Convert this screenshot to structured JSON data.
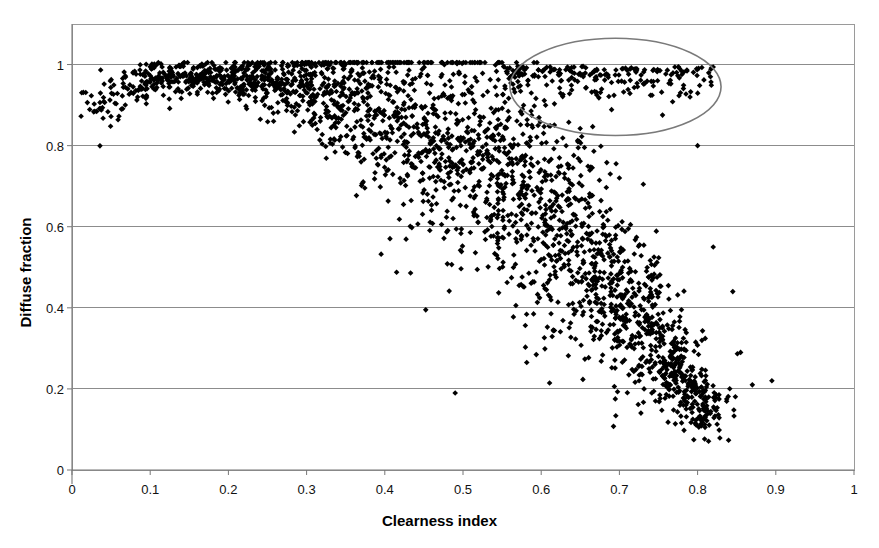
{
  "chart_data": {
    "type": "scatter",
    "title": "",
    "xlabel": "Clearness index",
    "ylabel": "Diffuse fraction",
    "xlim": [
      0,
      1
    ],
    "ylim": [
      0,
      1.1
    ],
    "xticks": [
      "0",
      "0.1",
      "0.2",
      "0.3",
      "0.4",
      "0.5",
      "0.6",
      "0.7",
      "0.8",
      "0.9",
      "1"
    ],
    "xtick_values": [
      0,
      0.1,
      0.2,
      0.3,
      0.4,
      0.5,
      0.6,
      0.7,
      0.8,
      0.9,
      1
    ],
    "yticks": [
      "0",
      "0.2",
      "0.4",
      "0.6",
      "0.8",
      "1"
    ],
    "ytick_values": [
      0,
      0.2,
      0.4,
      0.6,
      0.8,
      1
    ],
    "grid": "horizontal",
    "grid_color": "#808080",
    "legend": "none",
    "marker": {
      "shape": "diamond",
      "color": "#000000",
      "size_px": 5
    },
    "series": [
      {
        "name": "Diffuse fraction vs clearness index",
        "n_points": 2300,
        "description": "Dense scatter of hourly diffuse fraction against clearness index; near-unity plateau for kt below 0.35, steep falling limb between kt 0.35 and 0.8, low-diffuse tail near kt 0.8.",
        "distribution_bins": [
          {
            "kt": 0.02,
            "df_mean": 0.91,
            "df_spread": 0.05,
            "count": 14
          },
          {
            "kt": 0.05,
            "df_mean": 0.93,
            "df_spread": 0.05,
            "count": 28
          },
          {
            "kt": 0.08,
            "df_mean": 0.955,
            "df_spread": 0.04,
            "count": 42
          },
          {
            "kt": 0.11,
            "df_mean": 0.975,
            "df_spread": 0.03,
            "count": 55
          },
          {
            "kt": 0.14,
            "df_mean": 0.978,
            "df_spread": 0.03,
            "count": 62
          },
          {
            "kt": 0.17,
            "df_mean": 0.978,
            "df_spread": 0.035,
            "count": 68
          },
          {
            "kt": 0.2,
            "df_mean": 0.975,
            "df_spread": 0.04,
            "count": 72
          },
          {
            "kt": 0.23,
            "df_mean": 0.972,
            "df_spread": 0.05,
            "count": 76
          },
          {
            "kt": 0.26,
            "df_mean": 0.968,
            "df_spread": 0.06,
            "count": 80
          },
          {
            "kt": 0.29,
            "df_mean": 0.962,
            "df_spread": 0.075,
            "count": 84
          },
          {
            "kt": 0.32,
            "df_mean": 0.952,
            "df_spread": 0.095,
            "count": 88
          },
          {
            "kt": 0.35,
            "df_mean": 0.938,
            "df_spread": 0.115,
            "count": 92
          },
          {
            "kt": 0.38,
            "df_mean": 0.918,
            "df_spread": 0.14,
            "count": 96
          },
          {
            "kt": 0.41,
            "df_mean": 0.892,
            "df_spread": 0.165,
            "count": 100
          },
          {
            "kt": 0.44,
            "df_mean": 0.862,
            "df_spread": 0.185,
            "count": 104
          },
          {
            "kt": 0.47,
            "df_mean": 0.828,
            "df_spread": 0.195,
            "count": 108
          },
          {
            "kt": 0.5,
            "df_mean": 0.788,
            "df_spread": 0.205,
            "count": 112
          },
          {
            "kt": 0.53,
            "df_mean": 0.742,
            "df_spread": 0.21,
            "count": 116
          },
          {
            "kt": 0.56,
            "df_mean": 0.692,
            "df_spread": 0.215,
            "count": 118
          },
          {
            "kt": 0.59,
            "df_mean": 0.638,
            "df_spread": 0.215,
            "count": 120
          },
          {
            "kt": 0.62,
            "df_mean": 0.582,
            "df_spread": 0.21,
            "count": 122
          },
          {
            "kt": 0.65,
            "df_mean": 0.522,
            "df_spread": 0.2,
            "count": 124
          },
          {
            "kt": 0.68,
            "df_mean": 0.462,
            "df_spread": 0.185,
            "count": 126
          },
          {
            "kt": 0.71,
            "df_mean": 0.398,
            "df_spread": 0.165,
            "count": 128
          },
          {
            "kt": 0.74,
            "df_mean": 0.325,
            "df_spread": 0.14,
            "count": 130
          },
          {
            "kt": 0.77,
            "df_mean": 0.245,
            "df_spread": 0.105,
            "count": 126
          },
          {
            "kt": 0.795,
            "df_mean": 0.175,
            "df_spread": 0.075,
            "count": 98
          },
          {
            "kt": 0.815,
            "df_mean": 0.135,
            "df_spread": 0.055,
            "count": 46
          },
          {
            "kt": 0.835,
            "df_mean": 0.16,
            "df_spread": 0.06,
            "count": 12
          }
        ],
        "upper_branch": {
          "description": "Secondary high-diffuse population persisting to high clearness index, enclosed by annotation ellipse.",
          "kt_range": [
            0.55,
            0.82
          ],
          "df_mean": 0.975,
          "df_spread": 0.045,
          "count": 210
        },
        "outliers": [
          {
            "kt": 0.49,
            "df": 0.19
          },
          {
            "kt": 0.62,
            "df": 0.81
          },
          {
            "kt": 0.7,
            "df": 0.72
          },
          {
            "kt": 0.8,
            "df": 0.8
          },
          {
            "kt": 0.845,
            "df": 0.44
          },
          {
            "kt": 0.855,
            "df": 0.29
          },
          {
            "kt": 0.87,
            "df": 0.21
          },
          {
            "kt": 0.895,
            "df": 0.22
          },
          {
            "kt": 0.82,
            "df": 0.55
          }
        ]
      }
    ],
    "annotations": [
      {
        "type": "ellipse",
        "name": "high-diffuse-cluster-ellipse",
        "center_kt": 0.695,
        "center_df": 0.945,
        "radius_kt": 0.135,
        "radius_df": 0.12,
        "stroke": "#7a7a7a",
        "fill": "none",
        "stroke_width": 1.6
      }
    ]
  },
  "figure": {
    "plot_left_px": 72,
    "plot_right_px": 854,
    "plot_top_px": 24,
    "plot_bottom_px": 470,
    "background": "#ffffff",
    "frame_color": "#9a9a9a"
  }
}
